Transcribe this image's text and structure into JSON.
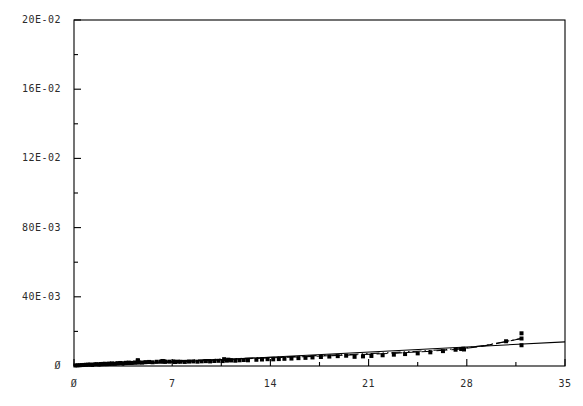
{
  "chart_data": {
    "type": "scatter",
    "title": "",
    "subtitle": "",
    "xlabel": "",
    "ylabel": "",
    "xlim": [
      0,
      35
    ],
    "ylim": [
      0,
      0.2
    ],
    "grid": false,
    "legend": null,
    "frame": {
      "left_px": 74,
      "right_px": 565,
      "top_px": 20,
      "bottom_px": 366
    },
    "x_ticks": [
      {
        "value": 0,
        "label": "Ø"
      },
      {
        "value": 7,
        "label": "7"
      },
      {
        "value": 14,
        "label": "14"
      },
      {
        "value": 21,
        "label": "21"
      },
      {
        "value": 28,
        "label": "28"
      },
      {
        "value": 35,
        "label": "35"
      }
    ],
    "x_minor_step": 3.5,
    "y_ticks": [
      {
        "value": 0.2,
        "label": "20E-02"
      },
      {
        "value": 0.16,
        "label": "16E-02"
      },
      {
        "value": 0.12,
        "label": "12E-02"
      },
      {
        "value": 0.08,
        "label": "80E-03"
      },
      {
        "value": 0.04,
        "label": "40E-03"
      },
      {
        "value": 0.0,
        "label": "Ø"
      }
    ],
    "y_minor_step": 0.02,
    "marker": {
      "shape": "filled-square-dot",
      "size_px": 4,
      "color": "#000000"
    },
    "series": [
      {
        "name": "data-points",
        "type": "scatter",
        "points": [
          [
            0.1,
            0.0003
          ],
          [
            0.25,
            0.0004
          ],
          [
            0.4,
            0.00045
          ],
          [
            0.55,
            0.00055
          ],
          [
            0.7,
            0.0006
          ],
          [
            0.85,
            0.0007
          ],
          [
            1.0,
            0.00075
          ],
          [
            1.15,
            0.00085
          ],
          [
            1.3,
            0.0006
          ],
          [
            1.45,
            0.00095
          ],
          [
            1.6,
            0.00105
          ],
          [
            1.75,
            0.0009
          ],
          [
            1.9,
            0.00115
          ],
          [
            2.05,
            0.0012
          ],
          [
            2.2,
            0.0013
          ],
          [
            2.35,
            0.0011
          ],
          [
            2.5,
            0.0014
          ],
          [
            2.7,
            0.0015
          ],
          [
            2.9,
            0.00135
          ],
          [
            3.1,
            0.00165
          ],
          [
            3.3,
            0.00175
          ],
          [
            3.5,
            0.0016
          ],
          [
            3.7,
            0.00185
          ],
          [
            3.9,
            0.00195
          ],
          [
            4.1,
            0.0018
          ],
          [
            4.35,
            0.00205
          ],
          [
            4.6,
            0.00215
          ],
          [
            4.55,
            0.00335
          ],
          [
            4.55,
            0.003
          ],
          [
            4.85,
            0.002
          ],
          [
            5.1,
            0.00225
          ],
          [
            5.35,
            0.00235
          ],
          [
            5.6,
            0.00215
          ],
          [
            5.9,
            0.00245
          ],
          [
            6.2,
            0.00255
          ],
          [
            6.5,
            0.0024
          ],
          [
            6.3,
            0.0029
          ],
          [
            6.35,
            0.00275
          ],
          [
            6.45,
            0.00265
          ],
          [
            6.8,
            0.0025
          ],
          [
            7.1,
            0.00265
          ],
          [
            7.4,
            0.0025
          ],
          [
            7.2,
            0.0023
          ],
          [
            7.6,
            0.00245
          ],
          [
            7.9,
            0.00235
          ],
          [
            8.2,
            0.00255
          ],
          [
            8.5,
            0.00265
          ],
          [
            8.8,
            0.0025
          ],
          [
            9.1,
            0.0027
          ],
          [
            9.4,
            0.0028
          ],
          [
            9.7,
            0.00265
          ],
          [
            10.0,
            0.0029
          ],
          [
            10.3,
            0.003
          ],
          [
            10.6,
            0.00285
          ],
          [
            10.9,
            0.0031
          ],
          [
            11.2,
            0.0032
          ],
          [
            11.5,
            0.00305
          ],
          [
            11.8,
            0.0033
          ],
          [
            12.1,
            0.00345
          ],
          [
            12.4,
            0.0033
          ],
          [
            10.7,
            0.00395
          ],
          [
            11.0,
            0.00365
          ],
          [
            13.0,
            0.0036
          ],
          [
            13.4,
            0.00375
          ],
          [
            13.8,
            0.00395
          ],
          [
            14.2,
            0.00385
          ],
          [
            14.6,
            0.004
          ],
          [
            15.0,
            0.00415
          ],
          [
            15.5,
            0.0043
          ],
          [
            16.0,
            0.00455
          ],
          [
            16.5,
            0.0047
          ],
          [
            17.0,
            0.00495
          ],
          [
            17.6,
            0.0052
          ],
          [
            18.2,
            0.00545
          ],
          [
            18.8,
            0.0057
          ],
          [
            19.4,
            0.00595
          ],
          [
            20.0,
            0.0053
          ],
          [
            20.6,
            0.00555
          ],
          [
            21.2,
            0.0058
          ],
          [
            22.0,
            0.0062
          ],
          [
            22.8,
            0.00655
          ],
          [
            23.6,
            0.0069
          ],
          [
            24.5,
            0.0073
          ],
          [
            25.4,
            0.0079
          ],
          [
            26.3,
            0.0086
          ],
          [
            27.2,
            0.0094
          ],
          [
            27.6,
            0.0098
          ],
          [
            27.75,
            0.01
          ],
          [
            27.8,
            0.00955
          ],
          [
            30.8,
            0.0143
          ],
          [
            31.9,
            0.0159
          ],
          [
            31.9,
            0.0189
          ],
          [
            31.9,
            0.012
          ]
        ]
      },
      {
        "name": "linear-fit",
        "type": "line",
        "style": "solid",
        "x": [
          1.75,
          35.0
        ],
        "y": [
          0.0,
          0.01395
        ]
      },
      {
        "name": "dash-dot-dot-fit",
        "type": "line",
        "style": "dash-dot-dot",
        "x": [
          0.2,
          3.0,
          6.0,
          9.5,
          13.0,
          16.5,
          20.0,
          23.0,
          25.5,
          27.5,
          29.2,
          30.5,
          31.9
        ],
        "y": [
          0.0002,
          0.0015,
          0.0027,
          0.0037,
          0.0047,
          0.00575,
          0.0068,
          0.0079,
          0.009,
          0.0101,
          0.0118,
          0.0137,
          0.01595
        ]
      },
      {
        "name": "dashed-fit",
        "type": "line",
        "style": "long-dash",
        "x": [
          0.2,
          3.0,
          6.0,
          9.5,
          13.0,
          16.5,
          20.0,
          23.0,
          25.5,
          27.6,
          29.0,
          30.4,
          31.9
        ],
        "y": [
          0.0001,
          0.00115,
          0.00225,
          0.00335,
          0.0044,
          0.0054,
          0.00645,
          0.00745,
          0.00855,
          0.00985,
          0.0113,
          0.0134,
          0.01595
        ]
      }
    ],
    "outliers": [
      {
        "x": 31.9,
        "y": 0.0189,
        "note": "high outlier top-right"
      },
      {
        "x": 31.9,
        "y": 0.012,
        "note": "low outlier right"
      },
      {
        "x": 4.55,
        "y": 0.00335,
        "note": "upper outlier pair"
      },
      {
        "x": 4.55,
        "y": 0.003,
        "note": "lower outlier pair"
      }
    ]
  },
  "axes": {
    "frame_color": "#000000",
    "text_color": "#2b2b2b"
  }
}
